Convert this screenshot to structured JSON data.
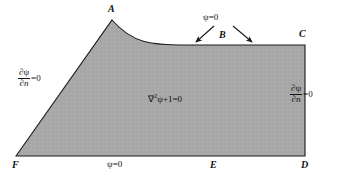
{
  "figure": {
    "background_color": "#ffffff",
    "region_fill_color": "#a8a8a8",
    "outline_color": "#1a1a1a",
    "domain_equation": {
      "operator": "∇",
      "exponent": "2",
      "variable": "ψ",
      "rest": "+1=0",
      "full": "∇²ψ+1=0"
    },
    "vertices": [
      {
        "id": "A",
        "label": "A"
      },
      {
        "id": "B",
        "label": "B"
      },
      {
        "id": "C",
        "label": "C"
      },
      {
        "id": "D",
        "label": "D"
      },
      {
        "id": "E",
        "label": "E"
      },
      {
        "id": "F",
        "label": "F"
      }
    ],
    "boundary_conditions": {
      "top_bc": "ψ=0",
      "bottom_bc": "ψ=0",
      "left_bc": {
        "numerator": "∂ψ",
        "denominator": "∂n",
        "tail": "=0",
        "full": "∂ψ/∂n=0"
      },
      "right_bc": {
        "numerator": "∂ψ",
        "denominator": "∂n",
        "tail": "=0",
        "full": "∂ψ/∂n=0"
      }
    },
    "arrows": [
      {
        "id": "left-arrow",
        "from": "psi-zero-top-label",
        "to": "boundary-segment-AB"
      },
      {
        "id": "right-arrow",
        "from": "psi-zero-top-label",
        "to": "boundary-segment-BC"
      }
    ]
  }
}
